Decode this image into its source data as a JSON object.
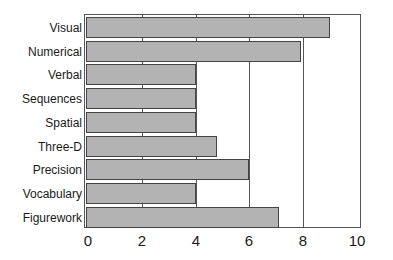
{
  "chart_data": {
    "type": "bar",
    "orientation": "horizontal",
    "title": "",
    "xlabel": "",
    "ylabel": "",
    "categories": [
      "Visual",
      "Numerical",
      "Verbal",
      "Sequences",
      "Spatial",
      "Three-D",
      "Precision",
      "Vocabulary",
      "Figurework"
    ],
    "values": [
      9.0,
      7.9,
      4.0,
      4.0,
      4.0,
      4.8,
      6.0,
      4.0,
      7.1
    ],
    "xlim": [
      0,
      10
    ],
    "xticks": [
      "0",
      "2",
      "4",
      "6",
      "8",
      "10"
    ],
    "grid": "vertical lines at 2,4,6,8",
    "legend": "none",
    "bar_color": "#b3b3b3"
  }
}
